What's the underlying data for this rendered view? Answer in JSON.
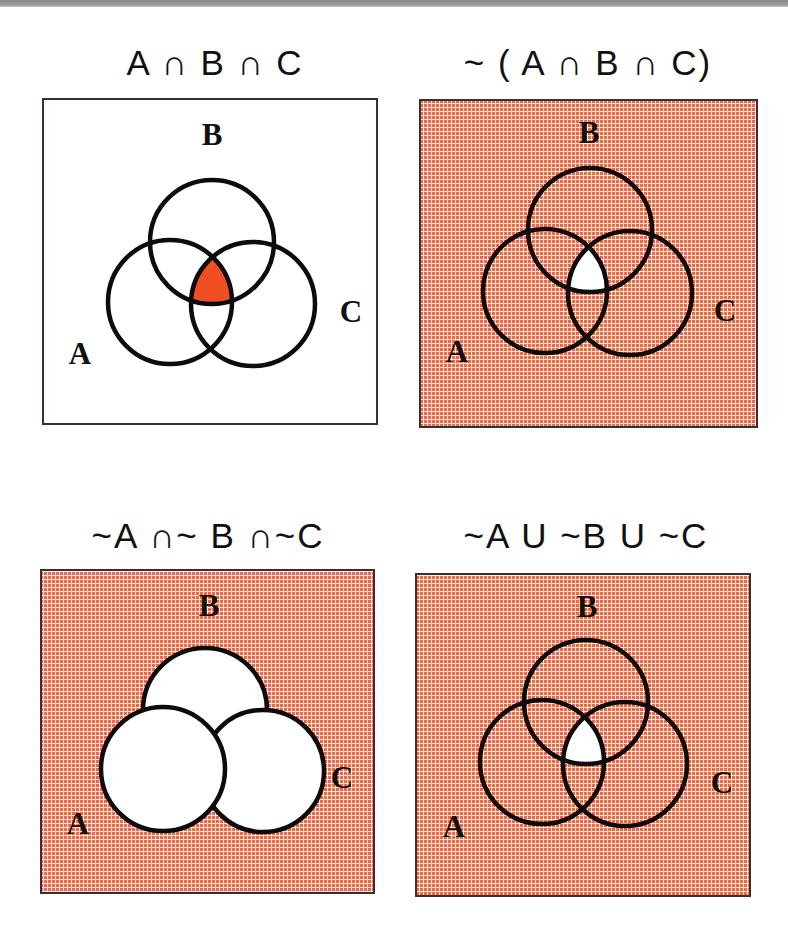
{
  "figure": {
    "colors": {
      "shade_base": "#e8654a",
      "shade_light": "#f8e6d8",
      "highlight": "#f04e23",
      "outline": "#0c0c0c",
      "background": "#ffffff"
    },
    "panels": [
      {
        "id": "a-and-b-and-c",
        "title": "A ∩ B ∩ C",
        "labels": {
          "a": "A",
          "b": "B",
          "c": "C"
        },
        "shaded_region": "intersection of A, B and C",
        "background_shaded": false,
        "center_region": "highlight",
        "style": "outline"
      },
      {
        "id": "not-a-and-b-and-c",
        "title": "~ ( A ∩ B ∩ C)",
        "labels": {
          "a": "A",
          "b": "B",
          "c": "C"
        },
        "shaded_region": "everything except the intersection of A, B and C",
        "background_shaded": true,
        "center_region": "white",
        "style": "outline"
      },
      {
        "id": "not-a-and-not-b-and-not-c",
        "title": "~A ∩~ B ∩~C",
        "labels": {
          "a": "A",
          "b": "B",
          "c": "C"
        },
        "shaded_region": "outside all three circles",
        "background_shaded": true,
        "center_region": "none",
        "style": "filled-white"
      },
      {
        "id": "not-a-or-not-b-or-not-c",
        "title": "~A U ~B U ~C",
        "labels": {
          "a": "A",
          "b": "B",
          "c": "C"
        },
        "shaded_region": "everything except the intersection of A, B and C",
        "background_shaded": true,
        "center_region": "white",
        "style": "outline"
      }
    ]
  }
}
